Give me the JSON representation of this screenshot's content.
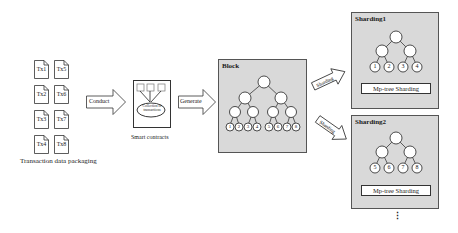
{
  "transactions": {
    "items": [
      "Tx1",
      "Tx5",
      "Tx2",
      "Tx6",
      "Tx3",
      "Tx7",
      "Tx4",
      "Tx8"
    ],
    "caption": "Transaction data packaging"
  },
  "arrows": {
    "conduct": "Conduct",
    "generate": "Generate",
    "sharding_up": "Sharding",
    "sharding_down": "Sharding"
  },
  "smart_contract": {
    "inner_label": "Collection of transactions",
    "caption": "Smart contracts"
  },
  "block": {
    "title": "Block",
    "leaves": [
      "1",
      "2",
      "3",
      "4",
      "5",
      "6",
      "7",
      "8"
    ]
  },
  "shardings": [
    {
      "title": "Sharding1",
      "leaves": [
        "1",
        "2",
        "3",
        "4"
      ],
      "footer": "Mp-tree Sharding"
    },
    {
      "title": "Sharding2",
      "leaves": [
        "5",
        "6",
        "7",
        "8"
      ],
      "footer": "Mp-tree Sharding"
    }
  ],
  "continuation": "⋮",
  "colors": {
    "panel_fill": "#d9d9d9",
    "stroke": "#333333"
  }
}
